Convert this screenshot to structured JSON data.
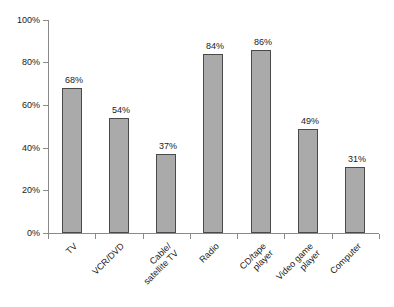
{
  "chart_data": {
    "type": "bar",
    "title": "",
    "subtitle": "",
    "xlabel": "",
    "ylabel": "",
    "ylim": [
      0,
      100
    ],
    "yticks": [
      "0%",
      "20%",
      "40%",
      "60%",
      "80%",
      "100%"
    ],
    "ytick_values": [
      0,
      20,
      40,
      60,
      80,
      100
    ],
    "grid": false,
    "legend": false,
    "legend_position": "none",
    "bar_color": "#aaaaaa",
    "bar_border_color": "#4a4a4a",
    "axis_color": "#8a8a8a",
    "background": "#ffffff",
    "categories": [
      "TV",
      "VCR/DVD",
      "Cable/satellite TV",
      "Radio",
      "CD/tape player",
      "Video game player",
      "Computer"
    ],
    "category_lines": [
      [
        "TV"
      ],
      [
        "VCR/DVD"
      ],
      [
        "Cable/",
        "satellite TV"
      ],
      [
        "Radio"
      ],
      [
        "CD/tape",
        "player"
      ],
      [
        "Video game",
        "player"
      ],
      [
        "Computer"
      ]
    ],
    "values": [
      68,
      54,
      37,
      84,
      86,
      49,
      31
    ],
    "data_labels": [
      "68%",
      "54%",
      "37%",
      "84%",
      "86%",
      "49%",
      "31%"
    ]
  }
}
